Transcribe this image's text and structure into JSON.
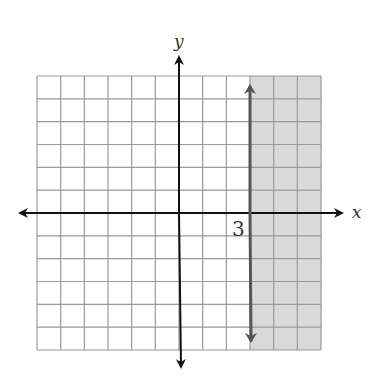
{
  "graph": {
    "title": "",
    "x_axis_label": "x",
    "y_axis_label": "y",
    "boundary_label": "3",
    "x_range": [
      -6,
      6
    ],
    "y_range": [
      -6,
      6
    ],
    "grid": true,
    "boundary": {
      "type": "vertical-line",
      "x": 3,
      "style": "solid",
      "arrows": "both-ends"
    },
    "shaded_region": "x >= 3",
    "colors": {
      "grid": "#9a9a9a",
      "axes": "#111111",
      "boundary": "#555555",
      "shade": "#d9d9d9"
    }
  },
  "chart_data": {
    "type": "inequality-graph",
    "inequality": "x ≥ 3",
    "boundary_line": "x = 3",
    "shaded_side": "right",
    "xlabel": "x",
    "ylabel": "y",
    "xlim": [
      -6,
      6
    ],
    "ylim": [
      -6,
      6
    ],
    "annotations": [
      "3"
    ],
    "grid": true
  }
}
